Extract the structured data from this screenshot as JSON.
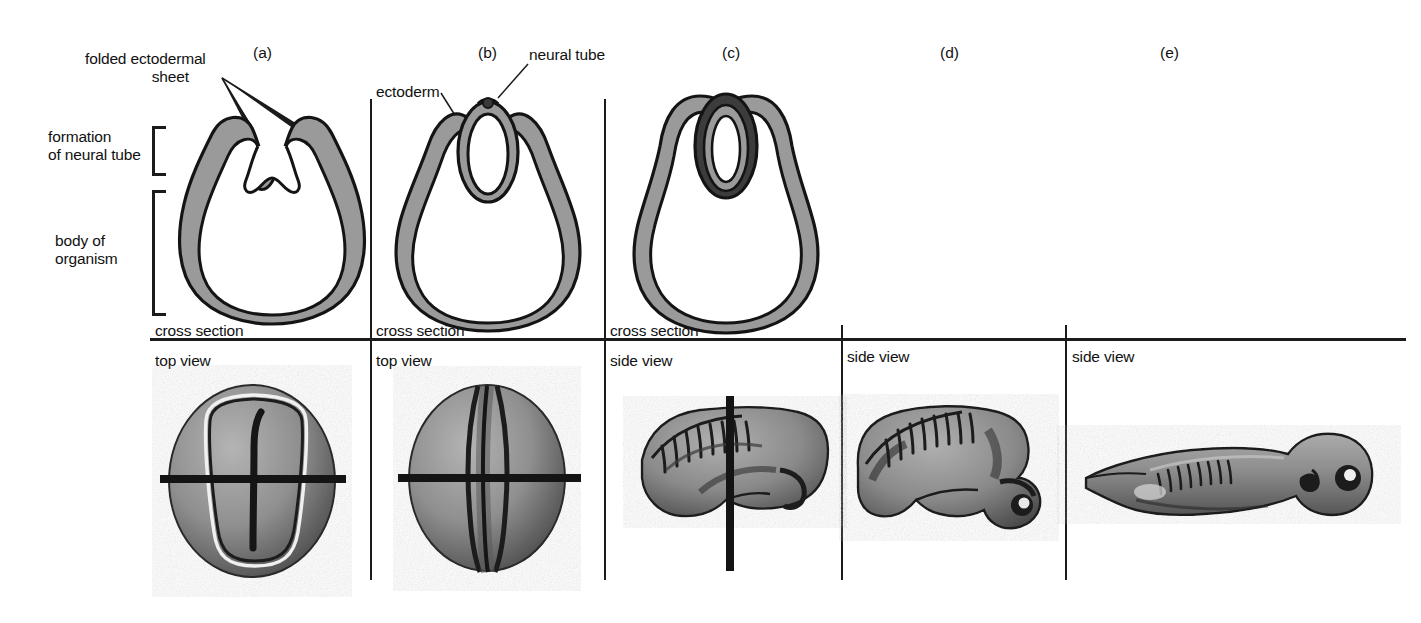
{
  "figure": {
    "background_color": "#ffffff",
    "ink_color": "#1b1b1b",
    "ectoderm_gray": "#9a9a9a",
    "tissue_gray": "#8f8f8f",
    "tissue_gray_dark": "#5e5e5e"
  },
  "annotations": {
    "folded_ectodermal_sheet": "folded ectodermal\n            sheet",
    "folded_ectodermal_sheet_plain": "folded ectodermal sheet",
    "formation_of_neural_tube": "formation\nof neural tube",
    "body_of_organism": "body of\norganism",
    "ectoderm": "ectoderm",
    "neural_tube": "neural tube"
  },
  "panels": [
    {
      "id": "a",
      "letter": "(a)",
      "upper_view_label": "cross section",
      "lower_view_label": "top view",
      "upper_description": "cross section of embryo with open neural groove and raised neural folds",
      "lower_description": "top view of embryo showing neural plate outline and midline groove with section line"
    },
    {
      "id": "b",
      "letter": "(b)",
      "upper_view_label": "cross section",
      "lower_view_label": "top view",
      "upper_description": "cross section with neural folds meeting at the midline closing the neural tube",
      "lower_description": "top view of embryo with neural folds converging at midline and section line"
    },
    {
      "id": "c",
      "letter": "(c)",
      "upper_view_label": "cross section",
      "lower_view_label": "side view",
      "upper_description": "cross section with fully closed neural tube internalized under the ectoderm",
      "lower_description": "side view of embryo with somite segments and vertical section line"
    },
    {
      "id": "d",
      "letter": "(d)",
      "upper_view_label": "",
      "lower_view_label": "side view",
      "upper_description": "",
      "lower_description": "side view of elongating embryo with developing head and eye"
    },
    {
      "id": "e",
      "letter": "(e)",
      "upper_view_label": "",
      "lower_view_label": "side view",
      "upper_description": "",
      "lower_description": "side view of tadpole larva with eye, gill, somites and tail"
    }
  ]
}
